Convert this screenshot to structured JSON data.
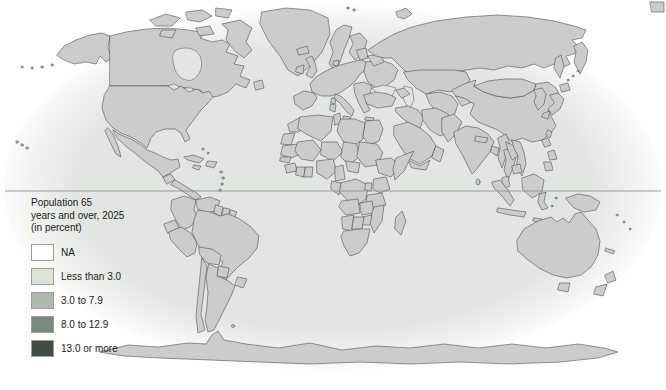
{
  "legend": {
    "title_lines": [
      "Population 65",
      "years and over, 2025",
      "(in percent)"
    ],
    "items": [
      {
        "label": "NA",
        "category": "na"
      },
      {
        "label": "Less than 3.0",
        "category": "lt3"
      },
      {
        "label": "3.0 to 7.9",
        "category": "c3to8"
      },
      {
        "label": "8.0 to 12.9",
        "category": "c8to13"
      },
      {
        "label": "13.0 or more",
        "category": "c13plus"
      }
    ]
  },
  "colors": {
    "na": "#ffffff",
    "lt3": "#dde2d6",
    "c3to8": "#aeb8ab",
    "c8to13": "#798a7d",
    "c13plus": "#414d43",
    "ocean": "#e2e5e1",
    "ocean_edge": "#fbfbfa",
    "border": "#4c5350",
    "equator": "#8f928f",
    "text": "#1a1a1a"
  },
  "map": {
    "type": "choropleth-world",
    "equator_line": true,
    "regions": {
      "alaska": "c8to13",
      "canada": "c8to13",
      "canadian-arctic": "c8to13",
      "newfoundland": "c8to13",
      "usa": "c8to13",
      "greenland": "na",
      "mexico": "c3to8",
      "guatemala": "na",
      "central-america": "lt3",
      "cuba": "c8to13",
      "hispaniola": "lt3",
      "jamaica": "lt3",
      "antilles": "lt3",
      "bahamas": "na",
      "hawaii": "lt3",
      "colombia": "c3to8",
      "venezuela": "c3to8",
      "guyana": "na",
      "suriname": "lt3",
      "french-guiana": "na",
      "ecuador": "c3to8",
      "peru": "c3to8",
      "brazil": "c3to8",
      "bolivia": "na",
      "paraguay": "na",
      "uruguay": "na",
      "argentina": "c8to13",
      "chile": "c8to13",
      "falkland": "na",
      "iceland": "c3to8",
      "ireland": "c13plus",
      "uk": "c13plus",
      "norway-sweden": "na",
      "finland": "c8to13",
      "denmark": "c13plus",
      "europe-west": "c13plus",
      "iberia": "c13plus",
      "italy": "c13plus",
      "italy-islands": "c13plus",
      "balkans": "c13plus",
      "ukraine": "c13plus",
      "baltics": "c13plus",
      "belarus": "c8to13",
      "russia": "c8to13",
      "sakhalin": "c8to13",
      "kurils": "c8to13",
      "novaya-zemlya": "c8to13",
      "svalbard": "na",
      "kazakhstan": "c3to8",
      "central-asia-white": "na",
      "kyrgyz-tajik": "c3to8",
      "caucasus": "c3to8",
      "turkey": "c8to13",
      "levant-iraq": "c3to8",
      "iran": "c3to8",
      "saudi-arabia": "lt3",
      "yemen": "lt3",
      "oman": "lt3",
      "pakistan": "c3to8",
      "india": "c3to8",
      "nepal": "na",
      "sri-lanka": "lt3",
      "bangladesh": "c3to8",
      "myanmar": "c3to8",
      "thailand": "c3to8",
      "laos": "na",
      "vietnam": "c3to8",
      "cambodia": "lt3",
      "malaysia": "lt3",
      "china": "c3to8",
      "taiwan": "c3to8",
      "mongolia": "na",
      "korea": "c13plus",
      "japan": "c13plus",
      "philippines": "c3to8",
      "sumatra": "c3to8",
      "java": "c3to8",
      "borneo": "c3to8",
      "sulawesi": "c3to8",
      "lesser-sunda": "lt3",
      "moluccas": "lt3",
      "new-guinea": "na",
      "australia": "c8to13",
      "tasmania": "c8to13",
      "new-zealand": "na",
      "fiji": "lt3",
      "new-caledonia": "lt3",
      "morocco": "c3to8",
      "western-sahara": "lt3",
      "algeria": "c3to8",
      "tunisia": "c8to13",
      "libya": "lt3",
      "egypt": "c3to8",
      "mauritania": "lt3",
      "mali": "na",
      "niger": "lt3",
      "chad": "lt3",
      "sudan": "lt3",
      "ethiopia": "lt3",
      "somalia": "lt3",
      "senegal": "lt3",
      "guinea": "na",
      "ivory-coast": "lt3",
      "ghana": "c3to8",
      "nigeria": "lt3",
      "cameroon": "c3to8",
      "central-african-republic": "lt3",
      "drc": "lt3",
      "congo-gabon": "c3to8",
      "uganda": "na",
      "kenya": "lt3",
      "tanzania": "lt3",
      "angola": "na",
      "zambia": "na",
      "mozambique": "lt3",
      "zimbabwe": "lt3",
      "namibia": "lt3",
      "botswana": "lt3",
      "south-africa": "c3to8",
      "madagascar": "lt3",
      "antarctica": "na",
      "hudson-bay": "ocean",
      "great-lakes": "ocean",
      "black-sea": "ocean",
      "caspian-sea": "ocean"
    }
  }
}
